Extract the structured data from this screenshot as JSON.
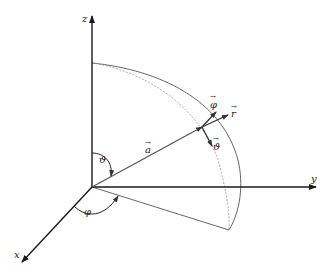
{
  "diagram": {
    "axes": {
      "x": {
        "label": "x"
      },
      "y": {
        "label": "y"
      },
      "z": {
        "label": "z"
      }
    },
    "vectors": {
      "position": {
        "label": "a"
      },
      "unit_r": {
        "label": "r"
      },
      "unit_phi": {
        "label": "φ"
      },
      "unit_theta": {
        "label": "ϑ"
      }
    },
    "angles": {
      "polar": {
        "label": "ϑ"
      },
      "azimuth": {
        "label": "φ"
      }
    },
    "colors": {
      "axis": "#1a1a1a",
      "vector": "#555555",
      "arc": "#666666",
      "dashed_arc": "#999999"
    }
  }
}
